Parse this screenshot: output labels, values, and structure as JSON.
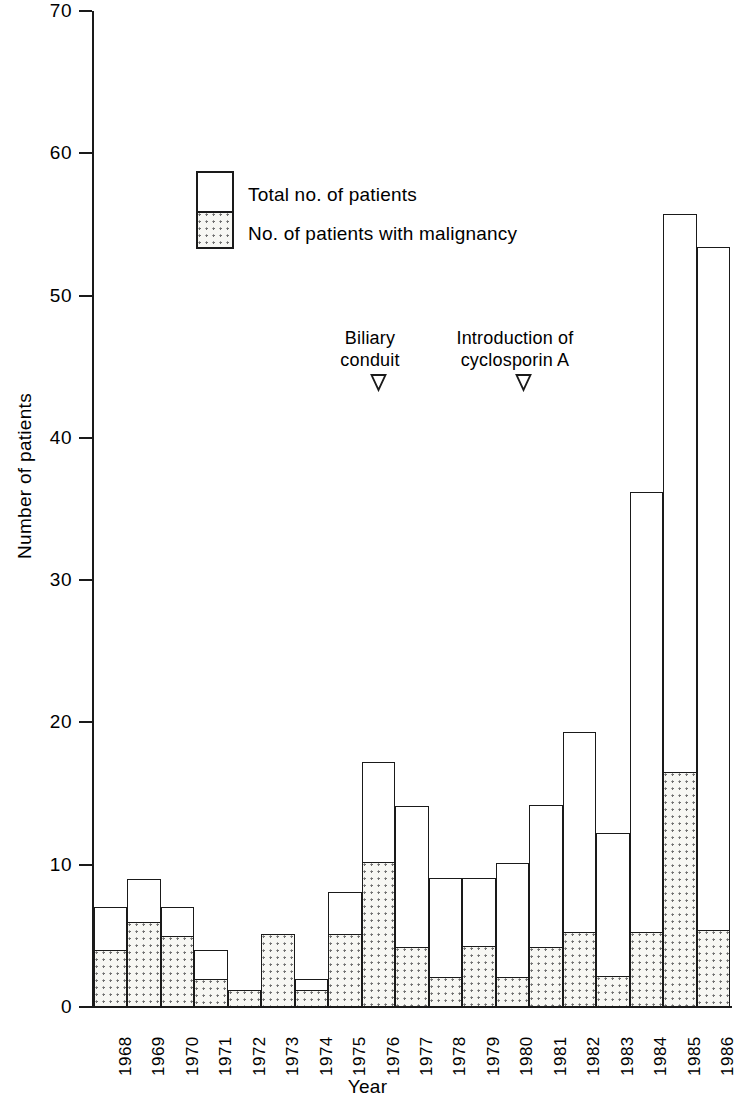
{
  "chart_data": {
    "type": "bar",
    "title": "",
    "xlabel": "Year",
    "ylabel": "Number of patients",
    "ylim": [
      0,
      70
    ],
    "yticks": [
      0,
      10,
      20,
      30,
      40,
      50,
      60,
      70
    ],
    "grid": false,
    "legend_position": "upper-left-inset",
    "stacked": true,
    "categories": [
      "1968",
      "1969",
      "1970",
      "1971",
      "1972",
      "1973",
      "1974",
      "1975",
      "1976",
      "1977",
      "1978",
      "1979",
      "1980",
      "1981",
      "1982",
      "1983",
      "1984",
      "1985",
      "1986"
    ],
    "series": [
      {
        "name": "Total no. of patients",
        "values": [
          7,
          9,
          7,
          4,
          1.2,
          5.1,
          2,
          8.1,
          17.2,
          14.1,
          9.1,
          9.1,
          10.1,
          14.2,
          19.3,
          12.2,
          36.2,
          55.7,
          53.4
        ]
      },
      {
        "name": "No. of patients with malignancy",
        "values": [
          4,
          6,
          5,
          2,
          1.2,
          5.1,
          1.2,
          5.1,
          10.2,
          4.2,
          2.1,
          4.3,
          2.1,
          4.2,
          5.3,
          2.2,
          5.3,
          16.5,
          5.4
        ]
      }
    ],
    "annotations": [
      {
        "text_line1": "Biliary",
        "text_line2": "conduit",
        "points_to_category": "1976",
        "marker": "down-arrow"
      },
      {
        "text_line1": "Introduction of",
        "text_line2": "cyclosporin A",
        "points_to_category": "1980",
        "marker": "down-arrow"
      }
    ]
  },
  "axes": {
    "y_title": "Number of patients",
    "x_title": "Year",
    "y_tick_labels": [
      "0",
      "10",
      "20",
      "30",
      "40",
      "50",
      "60",
      "70"
    ],
    "x_tick_labels": [
      "1968",
      "1969",
      "1970",
      "1971",
      "1972",
      "1973",
      "1974",
      "1975",
      "1976",
      "1977",
      "1978",
      "1979",
      "1980",
      "1981",
      "1982",
      "1983",
      "1984",
      "1985",
      "1986"
    ]
  },
  "legend": {
    "total_label": "Total no. of patients",
    "malignancy_label": "No. of patients with malignancy"
  },
  "annotations": {
    "biliary": {
      "line1": "Biliary",
      "line2": "conduit"
    },
    "cyclosporin": {
      "line1": "Introduction of",
      "line2": "cyclosporin A"
    }
  },
  "colors": {
    "ink": "#1a1a1a",
    "background": "#ffffff",
    "hatch_dot": "#6e6e6e",
    "hatch_fill": "#f7f7f3"
  }
}
